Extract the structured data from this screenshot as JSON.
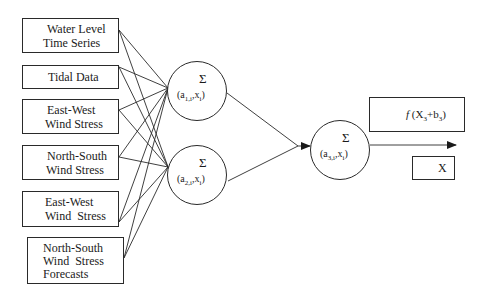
{
  "inputs": [
    {
      "line1": "Water Level",
      "line2": "Time Series",
      "line3": ""
    },
    {
      "line1": "Tidal Data",
      "line2": "",
      "line3": ""
    },
    {
      "line1": "East-West",
      "line2": "Wind Stress",
      "line3": ""
    },
    {
      "line1": "North-South",
      "line2": "Wind Stress",
      "line3": ""
    },
    {
      "line1": "East-West",
      "line2": "Wind  Stress",
      "line3": ""
    },
    {
      "line1": "North-South",
      "line2": "Wind  Stress",
      "line3": "Forecasts"
    }
  ],
  "hidden_nodes": [
    {
      "symbol": "Σ",
      "weight_open": "(a",
      "weight_sub": "1,i",
      "weight_close": "x",
      "x_sub": "i",
      "end": ")"
    },
    {
      "symbol": "Σ",
      "weight_open": "(a",
      "weight_sub": "2,i",
      "weight_close": "x",
      "x_sub": "i",
      "end": ")"
    }
  ],
  "output_node": {
    "symbol": "Σ",
    "weight_open": "(a",
    "weight_sub": "3,i",
    "weight_close": "x",
    "x_sub": "i",
    "end": ")"
  },
  "activation": {
    "f": "f",
    "open": " (X",
    "sub": "3",
    "plus": "+b",
    "sub2": "3",
    "close": ")"
  },
  "output_label": "X",
  "colors": {
    "stroke": "#2a2a2a",
    "background": "#ffffff"
  }
}
